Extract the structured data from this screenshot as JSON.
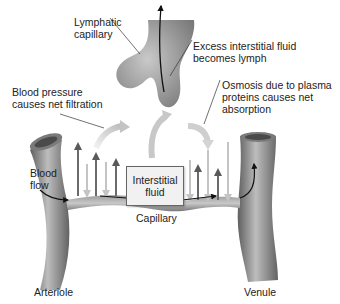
{
  "diagram": {
    "labels": {
      "lymphatic_capillary": "Lymphatic\ncapillary",
      "excess_fluid": "Excess interstitial fluid\nbecomes lymph",
      "blood_pressure": "Blood pressure\ncauses net filtration",
      "osmosis": "Osmosis due to plasma\nproteins causes net\nabsorption",
      "interstitial_fluid": "Interstitial\nfluid",
      "blood_flow": "Blood\nflow",
      "capillary": "Capillary",
      "arteriole": "Arteriole",
      "venule": "Venule"
    },
    "colors": {
      "vessel": "#8a8a8a",
      "vessel_dark": "#5f5f5f",
      "vessel_light": "#b5b5b5",
      "arrow_out": "#6b6b6b",
      "arrow_in": "#c4c4c4",
      "box_fill": "#f1f1f1",
      "flow_arrow": "#111111"
    }
  }
}
